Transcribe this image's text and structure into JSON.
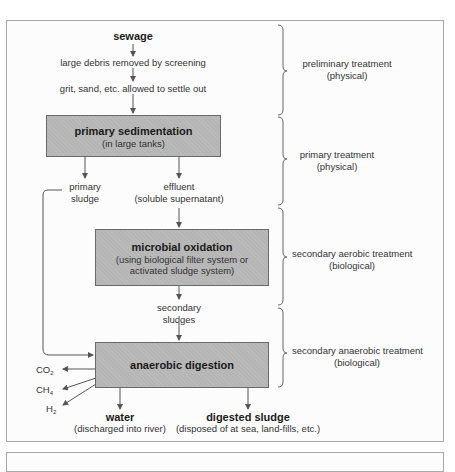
{
  "diagram": {
    "title_node": "sewage",
    "steps": [
      "large debris removed by screening",
      "grit, sand, etc. allowed to settle out"
    ],
    "boxes": {
      "primary": {
        "title": "primary sedimentation",
        "subtitle": "(in large tanks)"
      },
      "microbial": {
        "title": "microbial oxidation",
        "subtitle_line1": "(using biological filter system or",
        "subtitle_line2": "activated sludge system)"
      },
      "anaerobic": {
        "title": "anaerobic digestion"
      }
    },
    "branches": {
      "primary_sludge_line1": "primary",
      "primary_sludge_line2": "sludge",
      "effluent_line1": "effluent",
      "effluent_line2": "(soluble supernatant)",
      "secondary_line1": "secondary",
      "secondary_line2": "sludges"
    },
    "gases": {
      "co2": "CO",
      "co2_sub": "2",
      "ch4": "CH",
      "ch4_sub": "4",
      "h2": "H",
      "h2_sub": "2"
    },
    "outputs": {
      "water_title": "water",
      "water_sub": "(discharged into river)",
      "sludge_title": "digested sludge",
      "sludge_sub": "(disposed of at sea, land-fills, etc.)"
    },
    "stages": [
      {
        "line1": "preliminary treatment",
        "line2": "(physical)"
      },
      {
        "line1": "primary treatment",
        "line2": "(physical)"
      },
      {
        "line1": "secondary aerobic treatment",
        "line2": "(biological)"
      },
      {
        "line1": "secondary anaerobic treatment",
        "line2": "(biological)"
      }
    ],
    "colors": {
      "box_fill": "#b5b5b5",
      "box_border": "#6a6a6a",
      "line": "#555555",
      "frame": "#a8a8a8"
    }
  }
}
